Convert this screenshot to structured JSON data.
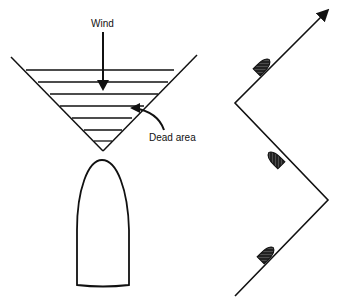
{
  "labels": {
    "wind": "Wind",
    "dead_area": "Dead area"
  },
  "colors": {
    "ink": "#111111",
    "background": "#ffffff"
  },
  "left_figure": {
    "description": "Boat heading into wind with no-go dead zone triangle",
    "hatch_lines": 7
  },
  "right_figure": {
    "description": "Zig-zag tacking course with three boats",
    "boats": 3
  }
}
